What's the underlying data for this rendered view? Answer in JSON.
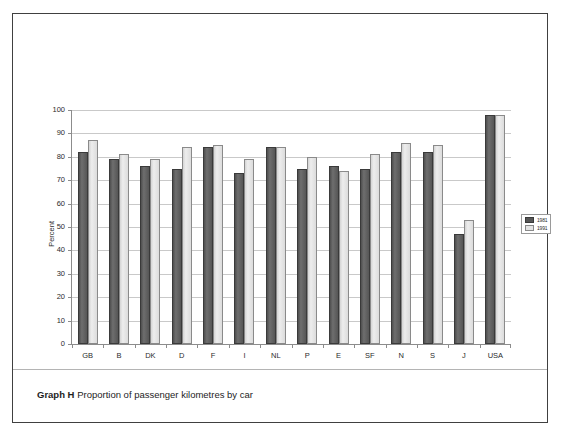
{
  "caption": {
    "label": "Graph H",
    "text": "Proportion of passenger kilometres by car"
  },
  "legend": {
    "entries": [
      {
        "label": "1981",
        "color": "#565656"
      },
      {
        "label": "1991",
        "color": "#e4e4e4"
      }
    ]
  },
  "chart_data": {
    "type": "bar",
    "title": "Proportion of passenger kilometres by car",
    "xlabel": "",
    "ylabel": "Percent",
    "ylim": [
      0,
      100
    ],
    "ytick_step": 10,
    "ytick_labels": [
      "0",
      "10",
      "20",
      "30",
      "40",
      "50",
      "60",
      "70",
      "80",
      "90",
      "100"
    ],
    "grid": true,
    "legend_position": "right",
    "categories": [
      "GB",
      "B",
      "DK",
      "D",
      "F",
      "I",
      "NL",
      "P",
      "E",
      "SF",
      "N",
      "S",
      "J",
      "USA"
    ],
    "series": [
      {
        "name": "1981",
        "color": "#565656",
        "values": [
          82,
          79,
          76,
          75,
          84,
          73,
          84,
          75,
          76,
          75,
          82,
          82,
          47,
          98
        ]
      },
      {
        "name": "1991",
        "color": "#e4e4e4",
        "values": [
          87,
          81,
          79,
          84,
          85,
          79,
          84,
          80,
          74,
          81,
          86,
          85,
          53,
          98
        ]
      }
    ]
  }
}
